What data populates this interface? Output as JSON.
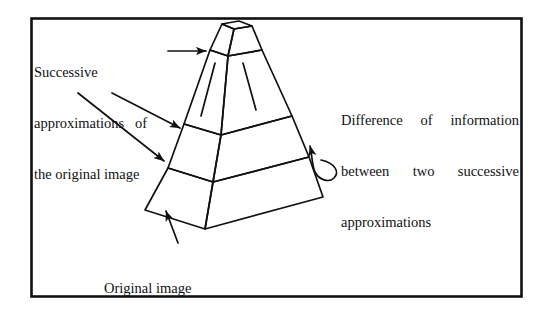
{
  "figure": {
    "type": "diagram",
    "background_color": "#ffffff",
    "ink_color": "#111111",
    "border": {
      "present": true,
      "style": "solid rectangle",
      "color": "#111111",
      "x": 31,
      "y": 18,
      "width": 491,
      "height": 279,
      "stroke_width": 2.5
    },
    "labels": {
      "successive": {
        "name": "Successive approximations of the original image",
        "lines": [
          "Successive",
          "approximations   of",
          "the original image"
        ]
      },
      "difference": {
        "name": "Difference of information between two successive approximations",
        "lines": [
          "Difference  of  information",
          "between   two   successive",
          "approximations"
        ],
        "justified_lines": [
          [
            "Difference",
            "of",
            "information"
          ],
          [
            "between",
            "two",
            "successive"
          ]
        ],
        "last_line": "approximations"
      },
      "original": {
        "name": "Original image",
        "lines": [
          "Original image"
        ]
      }
    },
    "pyramid": {
      "description": "Stepped truncated pyramid drawn in two-point perspective, four stacked levels, showing a left face and a right face plus a small flat top platform.",
      "levels": 4,
      "faces": [
        "top-platform",
        "left-face",
        "right-face"
      ],
      "apex_top_face": "small trapezoid",
      "stroke_width": 1.6
    },
    "arrows": [
      {
        "name": "arrow-to-apex-level",
        "from": "successive-label",
        "to": "pyramid-upper-left-edge",
        "style": "straight horizontal with solid head"
      },
      {
        "name": "arrow-to-mid-level",
        "from": "successive-label",
        "to": "pyramid-left-edge-upper-mid",
        "style": "straight diagonal with solid head"
      },
      {
        "name": "arrow-to-lower-level",
        "from": "successive-label",
        "to": "pyramid-left-edge-lower",
        "style": "straight diagonal with solid head"
      },
      {
        "name": "arrow-to-base",
        "from": "original-image-label",
        "to": "pyramid-base-front-edge",
        "style": "straight vertical with solid head"
      },
      {
        "name": "arrow-curved-to-layer",
        "from": "difference-label",
        "to": "pyramid-right-face-layer",
        "style": "curved hook with solid head pointing left"
      }
    ]
  }
}
